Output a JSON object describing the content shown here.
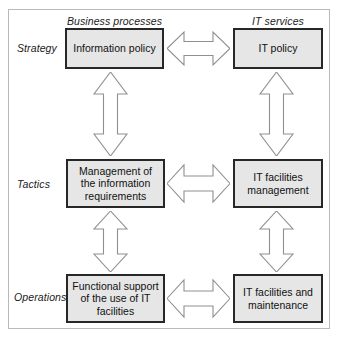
{
  "diagram": {
    "frame_border_color": "#b9b9b9",
    "box_fill_color": "#e6e6e6",
    "box_border_color": "#272727",
    "arrow_fill_color": "#ffffff",
    "arrow_stroke_color": "#8f8f8f",
    "columns": [
      {
        "key": "business_processes",
        "label": "Business processes"
      },
      {
        "key": "it_services",
        "label": "IT services"
      }
    ],
    "rows": [
      {
        "key": "strategy",
        "label": "Strategy"
      },
      {
        "key": "tactics",
        "label": "Tactics"
      },
      {
        "key": "operations",
        "label": "Operations"
      }
    ],
    "cells": {
      "strategy": {
        "business_processes": "Information policy",
        "it_services": "IT policy"
      },
      "tactics": {
        "business_processes": "Management of the information requirements",
        "it_services": "IT facilities management"
      },
      "operations": {
        "business_processes": "Functional support of the use of IT facilities",
        "it_services": "IT facilities and maintenance"
      }
    },
    "connectors": {
      "horizontal": [
        {
          "key": "strategy",
          "icon": "double-arrow-horizontal-icon"
        },
        {
          "key": "tactics",
          "icon": "double-arrow-horizontal-icon"
        },
        {
          "key": "operations",
          "icon": "double-arrow-horizontal-icon"
        }
      ],
      "vertical": [
        {
          "key": "business_strategy_tactics",
          "icon": "double-arrow-vertical-icon"
        },
        {
          "key": "it_strategy_tactics",
          "icon": "double-arrow-vertical-icon"
        },
        {
          "key": "business_tactics_operations",
          "icon": "double-arrow-vertical-icon"
        },
        {
          "key": "it_tactics_operations",
          "icon": "double-arrow-vertical-icon"
        }
      ]
    }
  }
}
